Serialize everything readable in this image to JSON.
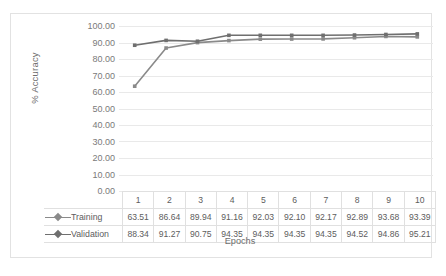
{
  "chart_data": {
    "type": "line",
    "title": "",
    "xlabel": "Epochs",
    "ylabel": "% Accuracy",
    "categories": [
      "1",
      "2",
      "3",
      "4",
      "5",
      "6",
      "7",
      "8",
      "9",
      "10"
    ],
    "ylim": [
      0,
      100
    ],
    "ytick_step": 10,
    "ytick_labels": [
      "100.00",
      "90.00",
      "80.00",
      "70.00",
      "60.00",
      "50.00",
      "40.00",
      "30.00",
      "20.00",
      "10.00",
      "0.00"
    ],
    "grid": "horizontal",
    "legend_position": "data-table-left",
    "series": [
      {
        "name": "Training",
        "color": "#8a8a8a",
        "marker": "square",
        "values": [
          63.51,
          86.64,
          89.94,
          91.16,
          92.03,
          92.1,
          92.17,
          92.89,
          93.68,
          93.39
        ],
        "labels": [
          "63.51",
          "86.64",
          "89.94",
          "91.16",
          "92.03",
          "92.10",
          "92.17",
          "92.89",
          "93.68",
          "93.39"
        ]
      },
      {
        "name": "Validation",
        "color": "#6f6f6f",
        "marker": "square",
        "values": [
          88.34,
          91.27,
          90.75,
          94.35,
          94.35,
          94.35,
          94.35,
          94.52,
          94.86,
          95.21
        ],
        "labels": [
          "88.34",
          "91.27",
          "90.75",
          "94.35",
          "94.35",
          "94.35",
          "94.35",
          "94.52",
          "94.86",
          "95.21"
        ]
      }
    ],
    "data_table": {
      "header_row": [
        "1",
        "2",
        "3",
        "4",
        "5",
        "6",
        "7",
        "8",
        "9",
        "10"
      ],
      "rows": [
        {
          "label": "Training",
          "values": [
            "63.51",
            "86.64",
            "89.94",
            "91.16",
            "92.03",
            "92.10",
            "92.17",
            "92.89",
            "93.68",
            "93.39"
          ]
        },
        {
          "label": "Validation",
          "values": [
            "88.34",
            "91.27",
            "90.75",
            "94.35",
            "94.35",
            "94.35",
            "94.35",
            "94.52",
            "94.86",
            "95.21"
          ]
        }
      ]
    }
  },
  "colors": {
    "frame_border": "#e2e2e2",
    "gridline": "#e9e9e9",
    "table_border": "#e0e0e0",
    "text": "#5d5d5d",
    "axis_text": "#7a7a7a",
    "series_training": "#8a8a8a",
    "series_validation": "#6f6f6f",
    "background": "#ffffff"
  }
}
